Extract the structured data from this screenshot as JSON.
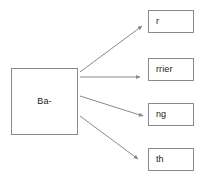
{
  "diagram": {
    "type": "flow-branch",
    "background_color": "#ffffff",
    "stroke_color": "#8a8a8a",
    "text_color": "#1a1a1a",
    "source": {
      "label": "Ba-",
      "x": 11,
      "y": 68,
      "width": 67,
      "height": 67
    },
    "targets": [
      {
        "label": "r",
        "x": 148,
        "y": 10,
        "width": 46,
        "height": 23
      },
      {
        "label": "rrier",
        "x": 148,
        "y": 58,
        "width": 46,
        "height": 23
      },
      {
        "label": "ng",
        "x": 148,
        "y": 103,
        "width": 46,
        "height": 23
      },
      {
        "label": "th",
        "x": 148,
        "y": 148,
        "width": 46,
        "height": 23
      }
    ],
    "arrows": [
      {
        "name": "arrow-to-r",
        "x1": 80,
        "y1": 72,
        "x2": 142,
        "y2": 26
      },
      {
        "name": "arrow-to-rrier",
        "x1": 80,
        "y1": 77,
        "x2": 143,
        "y2": 77
      },
      {
        "name": "arrow-to-ng",
        "x1": 80,
        "y1": 96,
        "x2": 145,
        "y2": 116
      },
      {
        "name": "arrow-to-th",
        "x1": 80,
        "y1": 116,
        "x2": 140,
        "y2": 160
      }
    ]
  }
}
